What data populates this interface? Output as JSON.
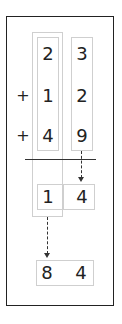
{
  "problem": {
    "tens_digits": [
      "2",
      "1",
      "4"
    ],
    "ones_digits": [
      "3",
      "2",
      "9"
    ],
    "operators": [
      "+",
      "+"
    ]
  },
  "partial_result": {
    "tens": "1",
    "ones": "4"
  },
  "final_result": {
    "tens": "8",
    "ones": "4"
  }
}
